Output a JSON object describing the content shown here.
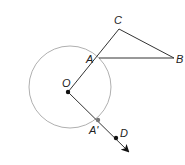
{
  "diagram": {
    "type": "geometry-rotation",
    "colors": {
      "background": "#ffffff",
      "line": "#333333",
      "circle": "#b0b0b0",
      "point": "#111111",
      "image_point": "#777777"
    },
    "circle": {
      "center_label": "O",
      "cx": 70,
      "cy": 87,
      "r": 41
    },
    "points": {
      "O": {
        "label": "O",
        "x": 68,
        "y": 92
      },
      "A": {
        "label": "A",
        "x": 99,
        "y": 58
      },
      "B": {
        "label": "B",
        "x": 174,
        "y": 58
      },
      "C": {
        "label": "C",
        "x": 119,
        "y": 29
      },
      "A_prime": {
        "label": "A'",
        "x": 98,
        "y": 120
      },
      "D": {
        "label": "D",
        "x": 116,
        "y": 138
      }
    },
    "segments": [
      {
        "from": "O",
        "to": "C"
      },
      {
        "from": "C",
        "to": "B"
      },
      {
        "from": "A",
        "to": "B"
      }
    ],
    "rays": [
      {
        "from": "O",
        "through": "D",
        "arrow_tip": {
          "x": 130,
          "y": 153
        }
      }
    ]
  }
}
